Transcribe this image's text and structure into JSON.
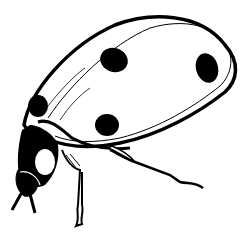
{
  "image": {
    "subject": "ladybug",
    "style": "black and white line drawing",
    "width": 243,
    "height": 244,
    "colors": {
      "ink": "#000000",
      "paper": "#ffffff"
    },
    "spots_count": 4
  }
}
